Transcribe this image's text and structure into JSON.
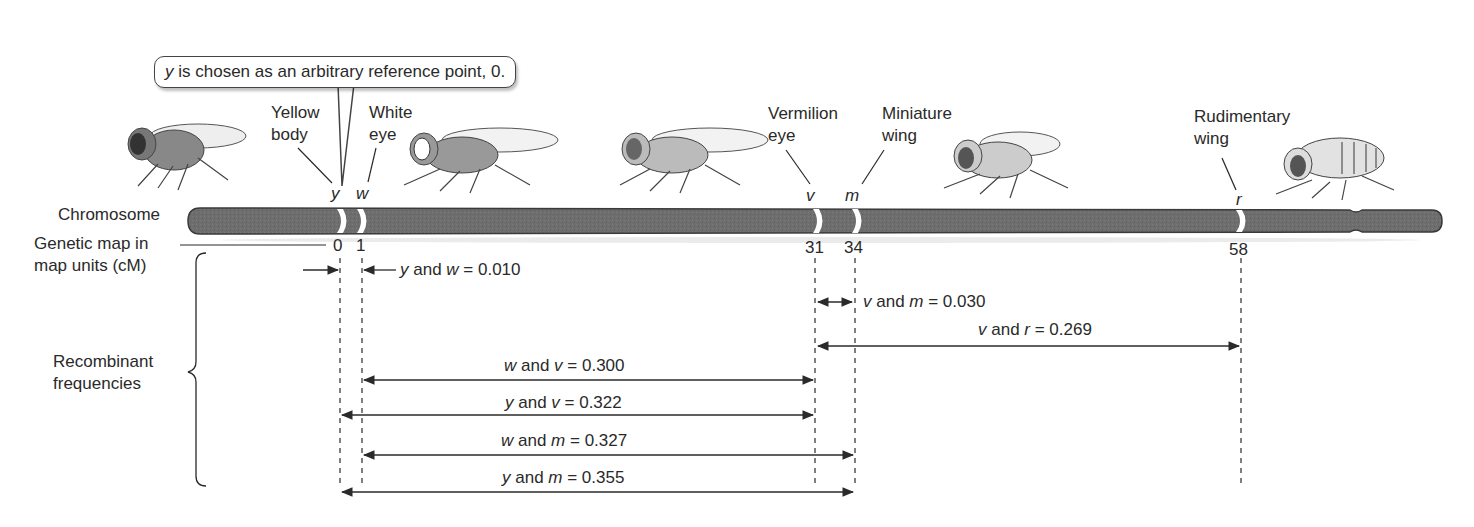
{
  "callout": {
    "locus": "y",
    "text": " is chosen as an arbitrary reference point, 0."
  },
  "labels": {
    "chromosome": "Chromosome",
    "genetic_map_line1": "Genetic map in",
    "genetic_map_line2": "map units (cM)",
    "recombinant_line1": "Recombinant",
    "recombinant_line2": "frequencies"
  },
  "genes": [
    {
      "symbol": "y",
      "name_line1": "Yellow",
      "name_line2": "body",
      "position_cM": 0
    },
    {
      "symbol": "w",
      "name_line1": "White",
      "name_line2": "eye",
      "position_cM": 1
    },
    {
      "symbol": "v",
      "name_line1": "Vermilion",
      "name_line2": "eye",
      "position_cM": 31
    },
    {
      "symbol": "m",
      "name_line1": "Miniature",
      "name_line2": "wing",
      "position_cM": 34
    },
    {
      "symbol": "r",
      "name_line1": "Rudimentary",
      "name_line2": "wing",
      "position_cM": 58
    }
  ],
  "ticks": [
    "0",
    "1",
    "31",
    "34",
    "58"
  ],
  "recombinant_frequencies": [
    {
      "a": "y",
      "b": "w",
      "value": "0.010"
    },
    {
      "a": "v",
      "b": "m",
      "value": "0.030"
    },
    {
      "a": "v",
      "b": "r",
      "value": "0.269"
    },
    {
      "a": "w",
      "b": "v",
      "value": "0.300"
    },
    {
      "a": "y",
      "b": "v",
      "value": "0.322"
    },
    {
      "a": "w",
      "b": "m",
      "value": "0.327"
    },
    {
      "a": "y",
      "b": "m",
      "value": "0.355"
    }
  ],
  "connector": " and ",
  "equals": " = ",
  "colors": {
    "chromosome": "#6e6e6e",
    "chromosome_edge": "#3a3a3a",
    "band": "#ffffff",
    "line": "#2a2a2a"
  }
}
